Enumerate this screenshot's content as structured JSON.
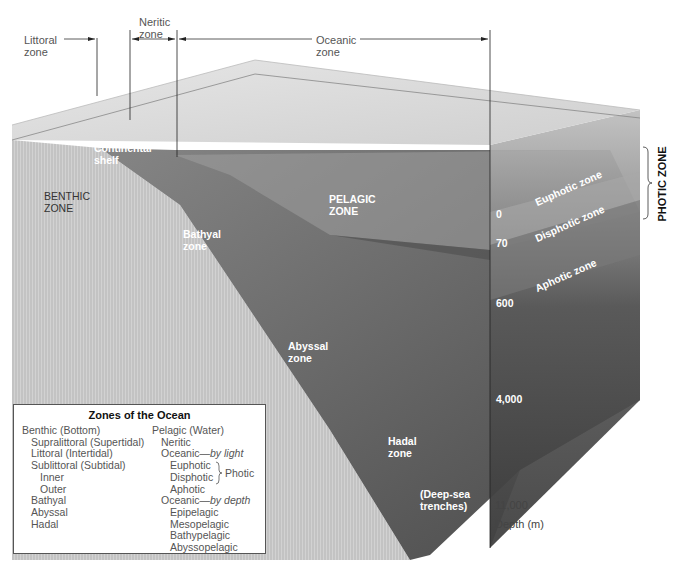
{
  "figure": {
    "type": "ocean-zones-block-diagram",
    "colors": {
      "background": "#ffffff",
      "water_surface": "#e2e2e2",
      "seafloor": "#6e6e6e",
      "benthic_wall": "#c9c9c9",
      "deep_water": "#4a4a4a",
      "label_dark": "#555555",
      "label_light": "#ffffff"
    }
  },
  "top_labels": {
    "littoral": "Littoral\nzone",
    "neritic": "Neritic\nzone",
    "oceanic": "Oceanic\nzone"
  },
  "region_labels": {
    "continental_shelf": "Continental\nshelf",
    "benthic_zone": "BENTHIC\nZONE",
    "pelagic_zone": "PELAGIC\nZONE",
    "bathyal_zone": "Bathyal\nzone",
    "abyssal_zone": "Abyssal\nzone",
    "hadal_zone": "Hadal\nzone",
    "deep_sea_trenches": "(Deep-sea\ntrenches)"
  },
  "light_zones": {
    "euphotic": "Euphotic zone",
    "disphotic": "Disphotic zone",
    "aphotic": "Aphotic zone",
    "photic_bracket": "PHOTIC ZONE"
  },
  "depth_scale": {
    "ticks": [
      "0",
      "70",
      "600",
      "4,000",
      "11,000"
    ],
    "unit_label": "Depth (m)"
  },
  "legend": {
    "title": "Zones of the Ocean",
    "benthic": {
      "heading": "Benthic (Bottom)",
      "items": [
        {
          "label": "Supralittoral (Supertidal)",
          "level": 1
        },
        {
          "label": "Littoral (Intertidal)",
          "level": 1
        },
        {
          "label": "Sublittoral (Subtidal)",
          "level": 1
        },
        {
          "label": "Inner",
          "level": 2
        },
        {
          "label": "Outer",
          "level": 2
        },
        {
          "label": "Bathyal",
          "level": 1
        },
        {
          "label": "Abyssal",
          "level": 1
        },
        {
          "label": "Hadal",
          "level": 1
        }
      ]
    },
    "pelagic": {
      "heading": "Pelagic (Water)",
      "neritic": "Neritic",
      "oceanic_light_prefix": "Oceanic—",
      "oceanic_light_suffix": "by light",
      "euphotic": "Euphotic",
      "disphotic": "Disphotic",
      "photic_brace_label": "Photic",
      "aphotic": "Aphotic",
      "oceanic_depth_prefix": "Oceanic—",
      "oceanic_depth_suffix": "by depth",
      "depth_items": [
        "Epipelagic",
        "Mesopelagic",
        "Bathypelagic",
        "Abyssopelagic"
      ]
    }
  }
}
